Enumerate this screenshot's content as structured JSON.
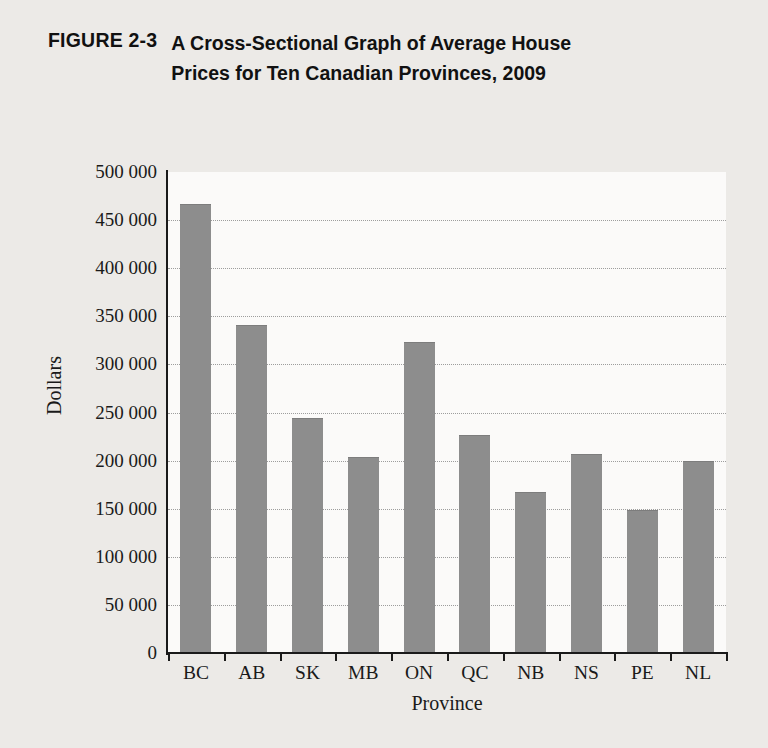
{
  "figure": {
    "number": "FIGURE 2-3",
    "title": "A Cross-Sectional Graph of Average House Prices for Ten Canadian Provinces, 2009"
  },
  "colors": {
    "page_background": "#eceae7",
    "plot_background": "#fbfaf9",
    "bar_fill": "#8d8d8d",
    "axis": "#1a1a1a",
    "gridline": "#9d9d9d"
  },
  "chart_data": {
    "type": "bar",
    "title": "A Cross-Sectional Graph of Average House Prices for Ten Canadian Provinces, 2009",
    "xlabel": "Province",
    "ylabel": "Dollars",
    "categories": [
      "BC",
      "AB",
      "SK",
      "MB",
      "ON",
      "QC",
      "NB",
      "NS",
      "PE",
      "NL"
    ],
    "values": [
      466000,
      340000,
      243000,
      203000,
      322000,
      226000,
      166000,
      206000,
      148000,
      199000
    ],
    "ylim": [
      0,
      500000
    ],
    "ytick_step": 50000,
    "ytick_labels": [
      "500 000",
      "450 000",
      "400 000",
      "350 000",
      "300 000",
      "250 000",
      "200 000",
      "150 000",
      "100 000",
      "50 000",
      "0"
    ],
    "ytick_values": [
      500000,
      450000,
      400000,
      350000,
      300000,
      250000,
      200000,
      150000,
      100000,
      50000,
      0
    ],
    "grid": true,
    "grid_style": "dotted-horizontal",
    "legend": null,
    "legend_position": "none"
  }
}
